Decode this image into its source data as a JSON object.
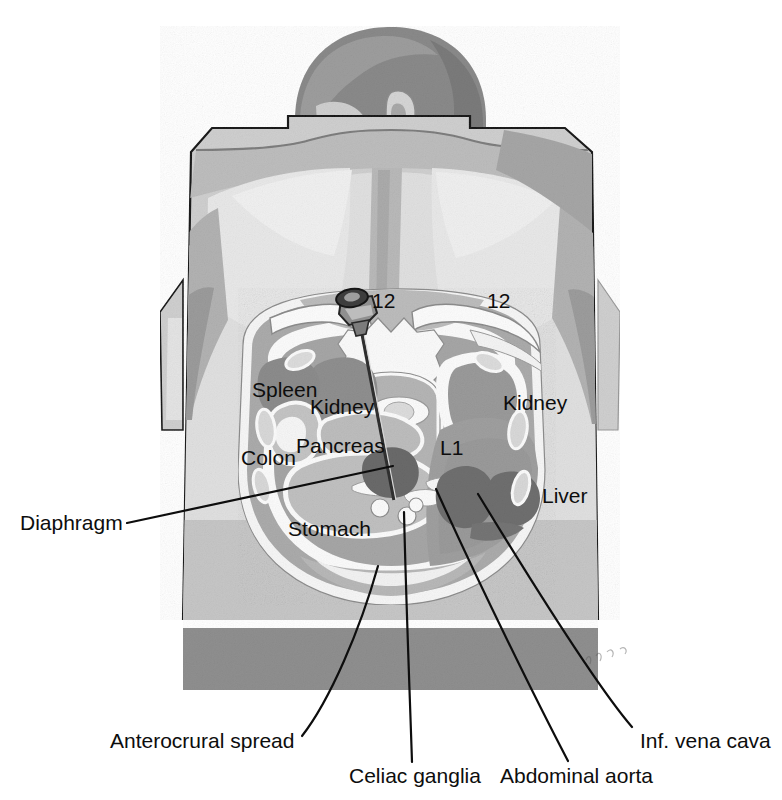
{
  "figure": {
    "type": "anatomical-illustration",
    "view": "posterior oblique, patient prone on table",
    "background_color": "#ffffff"
  },
  "palette": {
    "outline": "#1a1a1a",
    "skin_light": "#e2e2e2",
    "skin_mid": "#cfcfcf",
    "skin_shadow": "#b4b4b4",
    "hair_dark": "#8e8e8e",
    "hair_darker": "#7a7a7a",
    "muscle": "#a8a8a8",
    "fat_light": "#f2f2f2",
    "bone_white": "#fbfbfb",
    "organ_mid": "#9a9a9a",
    "organ_dark": "#808080",
    "vessel_dark": "#6e6e6e",
    "table_gray": "#8f8f8f",
    "needle_dark": "#3a3a3a",
    "label_text": "#0d0d0d"
  },
  "labels": {
    "internal": [
      {
        "id": "rib-12-left",
        "text": "12",
        "x": 372,
        "y": 290,
        "name": "rib-12-left-label"
      },
      {
        "id": "rib-12-right",
        "text": "12",
        "x": 487,
        "y": 290,
        "name": "rib-12-right-label"
      },
      {
        "id": "spleen",
        "text": "Spleen",
        "x": 252,
        "y": 379,
        "name": "spleen-label"
      },
      {
        "id": "kidney-left",
        "text": "Kidney",
        "x": 310,
        "y": 396,
        "name": "kidney-left-label"
      },
      {
        "id": "kidney-right",
        "text": "Kidney",
        "x": 503,
        "y": 392,
        "name": "kidney-right-label"
      },
      {
        "id": "l1",
        "text": "L1",
        "x": 440,
        "y": 437,
        "name": "vertebra-l1-label"
      },
      {
        "id": "pancreas",
        "text": "Pancreas",
        "x": 296,
        "y": 435,
        "name": "pancreas-label"
      },
      {
        "id": "colon",
        "text": "Colon",
        "x": 241,
        "y": 447,
        "name": "colon-label"
      },
      {
        "id": "stomach",
        "text": "Stomach",
        "x": 288,
        "y": 518,
        "name": "stomach-label"
      },
      {
        "id": "liver",
        "text": "Liver",
        "x": 542,
        "y": 485,
        "name": "liver-label"
      }
    ],
    "callouts": [
      {
        "id": "diaphragm",
        "text": "Diaphragm",
        "x": 20,
        "y": 522,
        "name": "diaphragm-label",
        "leader": {
          "x1": 127,
          "y1": 523,
          "x2": 393,
          "y2": 466
        }
      },
      {
        "id": "anterocrural-spread",
        "text": "Anterocrural spread",
        "x": 110,
        "y": 740,
        "name": "anterocrural-spread-label",
        "leader": {
          "x1": 302,
          "y1": 736,
          "x2": 378,
          "y2": 566
        }
      },
      {
        "id": "celiac-ganglia",
        "text": "Celiac ganglia",
        "x": 349,
        "y": 775,
        "name": "celiac-ganglia-label",
        "leader": {
          "x1": 412,
          "y1": 762,
          "x2": 404,
          "y2": 512
        }
      },
      {
        "id": "abdominal-aorta",
        "text": "Abdominal aorta",
        "x": 500,
        "y": 775,
        "name": "abdominal-aorta-label",
        "leader": {
          "x1": 568,
          "y1": 761,
          "x2": 436,
          "y2": 489
        }
      },
      {
        "id": "inf-vena-cava",
        "text": "Inf. vena cava",
        "x": 640,
        "y": 740,
        "name": "inf-vena-cava-label",
        "leader": {
          "x1": 632,
          "y1": 727,
          "x2": 478,
          "y2": 494
        }
      }
    ]
  },
  "instrument": {
    "name": "block-needle",
    "description": "single posterior transcrural needle with hub, entering left paraspinal, tip anterior to aorta"
  }
}
